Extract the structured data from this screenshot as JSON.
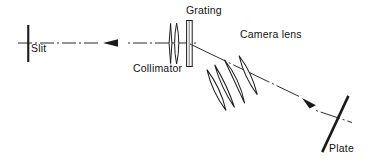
{
  "figure": {
    "type": "optical-ray-diagram",
    "background_color": "#ffffff",
    "ink_color": "#1a1a1a"
  },
  "labels": {
    "slit": "Slit",
    "collimator": "Collimator",
    "grating": "Grating",
    "camera_lens": "Camera  lens",
    "plate": "Plate"
  },
  "components": [
    {
      "name": "slit",
      "label": "Slit",
      "kind": "vertical-bar",
      "x": 28,
      "y_top": 25,
      "y_bottom": 62,
      "label_x": 31,
      "label_y": 52
    },
    {
      "name": "collimator",
      "label": "Collimator",
      "kind": "lens-doublet",
      "element_count": 2,
      "x_center": 175,
      "label_x": 133,
      "label_y": 72
    },
    {
      "name": "grating",
      "label": "Grating",
      "kind": "ruled-plate",
      "x_center": 190,
      "label_x": 186,
      "label_y": 14
    },
    {
      "name": "camera-lens",
      "label": "Camera  lens",
      "kind": "lens-group-tilted",
      "element_count": 4,
      "tilt_degrees": -25,
      "label_x": 240,
      "label_y": 38
    },
    {
      "name": "plate",
      "label": "Plate",
      "kind": "photographic-plate",
      "tilt_degrees": -65,
      "label_x": 329,
      "label_y": 152
    }
  ],
  "beams": [
    {
      "name": "incident-beam",
      "style": "dash-dot",
      "from": [
        18,
        43
      ],
      "to": [
        196,
        43
      ],
      "arrow_at": [
        118,
        43
      ],
      "arrow_direction": "right"
    },
    {
      "name": "diffracted-beam",
      "style": "dash-dot",
      "from": [
        190,
        44
      ],
      "to": [
        350,
        121
      ],
      "arrow_at": [
        311,
        106
      ],
      "arrow_direction": "down-right"
    }
  ]
}
